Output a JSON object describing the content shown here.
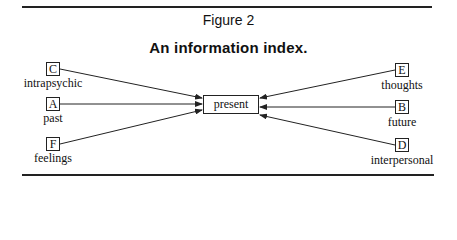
{
  "figure": {
    "label": "Figure 2",
    "title": "An information index."
  },
  "center": {
    "label": "present"
  },
  "nodes": [
    {
      "id": "C",
      "letter": "C",
      "label": "intrapsychic",
      "side": "left"
    },
    {
      "id": "A",
      "letter": "A",
      "label": "past",
      "side": "left"
    },
    {
      "id": "F",
      "letter": "F",
      "label": "feelings",
      "side": "left"
    },
    {
      "id": "E",
      "letter": "E",
      "label": "thoughts",
      "side": "right"
    },
    {
      "id": "B",
      "letter": "B",
      "label": "future",
      "side": "right"
    },
    {
      "id": "D",
      "letter": "D",
      "label": "interpersonal",
      "side": "right"
    }
  ],
  "edges": [
    {
      "from": "C",
      "to": "present"
    },
    {
      "from": "A",
      "to": "present"
    },
    {
      "from": "F",
      "to": "present"
    },
    {
      "from": "E",
      "to": "present"
    },
    {
      "from": "B",
      "to": "present"
    },
    {
      "from": "D",
      "to": "present"
    }
  ],
  "colors": {
    "ink": "#222222",
    "background": "#ffffff"
  }
}
